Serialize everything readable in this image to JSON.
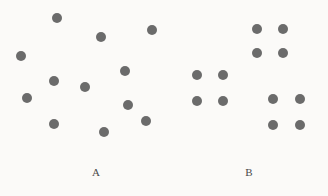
{
  "figure": {
    "name": "two-panel-dot-array-stimulus",
    "width": 328,
    "height": 196,
    "background_color": "#fbfaf8",
    "dot_color": "#6b6b6b",
    "label_color": "#4a4a4a",
    "dot_diameter": 10
  },
  "chart_data": {
    "type": "scatter",
    "title": "",
    "xlabel": "",
    "ylabel": "",
    "xlim": [
      0,
      328
    ],
    "ylim": [
      196,
      0
    ],
    "grid": false,
    "legend": "none",
    "note": "Pixel coordinates, y increases downward; two panels of 12 dots each: panel A randomly scattered, panel B arranged in three 2x2 square groups",
    "series": [
      {
        "name": "A",
        "label": "A",
        "count": 12,
        "arrangement": "random-scatter",
        "points": [
          {
            "x": 57,
            "y": 18
          },
          {
            "x": 101,
            "y": 37
          },
          {
            "x": 152,
            "y": 30
          },
          {
            "x": 21,
            "y": 56
          },
          {
            "x": 125,
            "y": 71
          },
          {
            "x": 54,
            "y": 81
          },
          {
            "x": 85,
            "y": 87
          },
          {
            "x": 27,
            "y": 98
          },
          {
            "x": 128,
            "y": 105
          },
          {
            "x": 54,
            "y": 124
          },
          {
            "x": 146,
            "y": 121
          },
          {
            "x": 104,
            "y": 132
          }
        ]
      },
      {
        "name": "B",
        "label": "B",
        "count": 12,
        "arrangement": "three-2x2-groups",
        "points": [
          {
            "x": 257,
            "y": 29
          },
          {
            "x": 283,
            "y": 29
          },
          {
            "x": 257,
            "y": 53
          },
          {
            "x": 283,
            "y": 53
          },
          {
            "x": 197,
            "y": 75
          },
          {
            "x": 223,
            "y": 75
          },
          {
            "x": 197,
            "y": 101
          },
          {
            "x": 223,
            "y": 101
          },
          {
            "x": 273,
            "y": 99
          },
          {
            "x": 300,
            "y": 99
          },
          {
            "x": 273,
            "y": 125
          },
          {
            "x": 300,
            "y": 125
          }
        ]
      }
    ],
    "labels": [
      {
        "text": "A",
        "x": 96,
        "y": 172
      },
      {
        "text": "B",
        "x": 249,
        "y": 172
      }
    ]
  }
}
